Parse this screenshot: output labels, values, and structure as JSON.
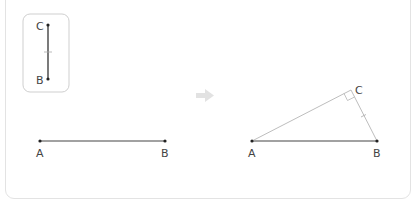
{
  "diagram": {
    "given_segment": {
      "top_label": "C",
      "bottom_label": "B"
    },
    "base_segment": {
      "left_label": "A",
      "right_label": "B"
    },
    "arrow": "right-arrow-icon",
    "result_triangle": {
      "vertex_a": "A",
      "vertex_b": "B",
      "vertex_c": "C",
      "right_angle_at": "C"
    }
  },
  "colors": {
    "line": "#333333",
    "thin_line": "#b0b0b0",
    "frame": "#e3e3e3",
    "arrow": "#e0e0e0"
  }
}
